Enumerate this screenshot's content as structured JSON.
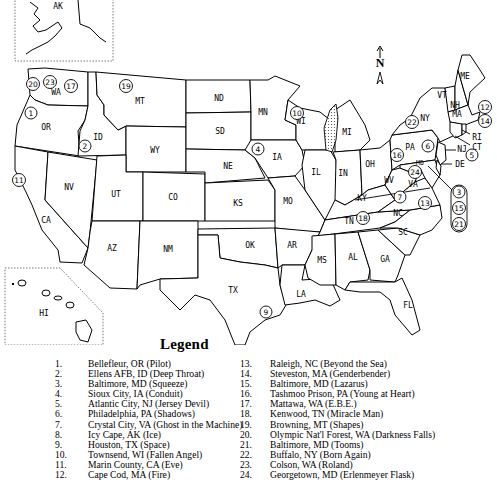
{
  "compass": {
    "letter": "N",
    "up_arrow": "↑",
    "tail": "⩓"
  },
  "insets": {
    "alaska": "AK",
    "hawaii": "HI"
  },
  "states": {
    "WA": "WA",
    "OR": "OR",
    "CA": "CA",
    "ID": "ID",
    "NV": "NV",
    "MT": "MT",
    "WY": "WY",
    "UT": "UT",
    "CO": "CO",
    "AZ": "AZ",
    "NM": "NM",
    "ND": "ND",
    "SD": "SD",
    "NE": "NE",
    "KS": "KS",
    "OK": "OK",
    "TX": "TX",
    "MN": "MN",
    "IA": "IA",
    "MO": "MO",
    "AR": "AR",
    "LA": "LA",
    "WI": "WI",
    "IL": "IL",
    "MI": "MI",
    "IN": "IN",
    "OH": "OH",
    "KY": "KY",
    "TN": "TN",
    "MS": "MS",
    "AL": "AL",
    "GA": "GA",
    "FL": "FL",
    "SC": "SC",
    "NC": "NC",
    "VA": "VA",
    "WV": "WV",
    "PA": "PA",
    "NY": "NY",
    "VT": "VT",
    "NH": "NH",
    "ME": "ME",
    "MA": "MA",
    "RI": "RI",
    "CT": "CT",
    "NJ": "NJ",
    "DE": "DE",
    "MD": "MD"
  },
  "markers": [
    {
      "n": "1"
    },
    {
      "n": "2"
    },
    {
      "n": "3"
    },
    {
      "n": "4"
    },
    {
      "n": "5"
    },
    {
      "n": "6"
    },
    {
      "n": "7"
    },
    {
      "n": "8"
    },
    {
      "n": "9"
    },
    {
      "n": "10"
    },
    {
      "n": "11"
    },
    {
      "n": "12"
    },
    {
      "n": "13"
    },
    {
      "n": "14"
    },
    {
      "n": "15"
    },
    {
      "n": "16"
    },
    {
      "n": "17"
    },
    {
      "n": "18"
    },
    {
      "n": "19"
    },
    {
      "n": "20"
    },
    {
      "n": "21"
    },
    {
      "n": "22"
    },
    {
      "n": "23"
    },
    {
      "n": "24"
    }
  ],
  "legend": {
    "title": "Legend",
    "items": [
      {
        "num": "1.",
        "text": "Bellefleur, OR (Pilot)"
      },
      {
        "num": "2.",
        "text": "Ellens AFB, ID (Deep Throat)"
      },
      {
        "num": "3.",
        "text": "Baltimore, MD (Squeeze)"
      },
      {
        "num": "4.",
        "text": "Sioux City, IA (Conduit)"
      },
      {
        "num": "5.",
        "text": "Atlantic City, NJ (Jersey Devil)"
      },
      {
        "num": "6.",
        "text": "Philadelphia, PA (Shadows)"
      },
      {
        "num": "7.",
        "text": "Crystal City, VA (Ghost in the Machine)"
      },
      {
        "num": "8.",
        "text": "Icy Cape, AK (Ice)"
      },
      {
        "num": "9.",
        "text": "Houston, TX (Space)"
      },
      {
        "num": "10.",
        "text": "Townsend, WI (Fallen Angel)"
      },
      {
        "num": "11.",
        "text": "Marin County, CA (Eve)"
      },
      {
        "num": "12.",
        "text": "Cape Cod, MA (Fire)"
      },
      {
        "num": "13.",
        "text": "Raleigh, NC (Beyond the Sea)"
      },
      {
        "num": "14.",
        "text": "Steveston, MA (Genderbender)"
      },
      {
        "num": "15.",
        "text": "Baltimore, MD (Lazarus)"
      },
      {
        "num": "16.",
        "text": "Tashmoo Prison, PA (Young at Heart)"
      },
      {
        "num": "17.",
        "text": "Mattawa, WA (E.B.E.)"
      },
      {
        "num": "18.",
        "text": "Kenwood, TN (Miracle Man)"
      },
      {
        "num": "19.",
        "text": "Browning, MT (Shapes)"
      },
      {
        "num": "20.",
        "text": "Olympic Nat'l Forest, WA (Darkness Falls)"
      },
      {
        "num": "21.",
        "text": "Baltimore, MD (Tooms)"
      },
      {
        "num": "22.",
        "text": "Buffalo, NY (Born Again)"
      },
      {
        "num": "23.",
        "text": "Colson, WA (Roland)"
      },
      {
        "num": "24.",
        "text": "Georgetown, MD (Erlenmeyer Flask)"
      }
    ]
  }
}
